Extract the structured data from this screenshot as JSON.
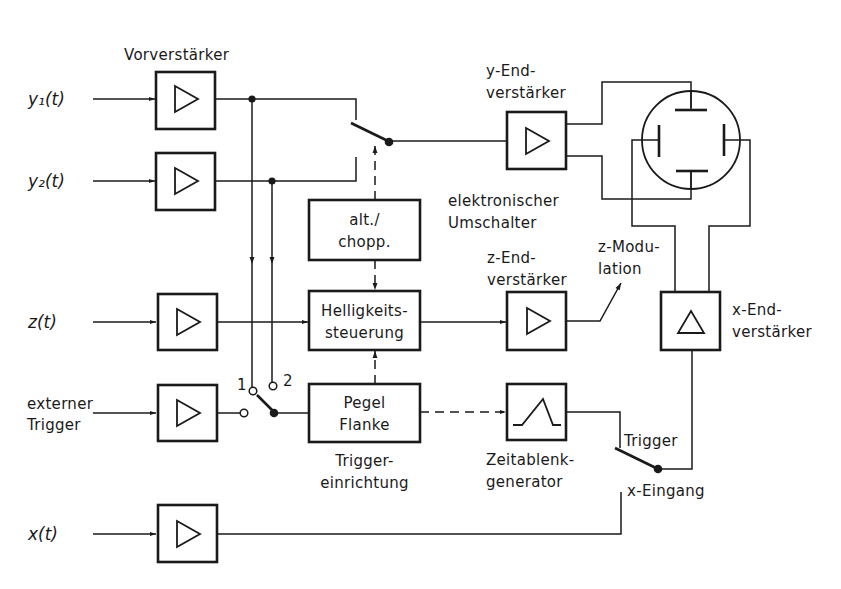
{
  "inputs": {
    "y1": "y₁(t)",
    "y2": "y₂(t)",
    "z": "z(t)",
    "ext_trigger": [
      "externer",
      "Trigger"
    ],
    "x": "x(t)"
  },
  "labels": {
    "preamp": "Vorverstärker",
    "alt_chopp": [
      "alt./",
      "chopp."
    ],
    "helligkeit": [
      "Helligkeits-",
      "steuerung"
    ],
    "pegel": [
      "Pegel",
      "Flanke"
    ],
    "trigger_einrichtung": [
      "Trigger-",
      "einrichtung"
    ],
    "y_end": [
      "y-End-",
      "verstärker"
    ],
    "elektronischer_umschalter": [
      "elektronischer",
      "Umschalter"
    ],
    "z_end": [
      "z-End-",
      "verstärker"
    ],
    "z_modulation": [
      "z-Modu-",
      "lation"
    ],
    "x_end": [
      "x-End-",
      "verstärker"
    ],
    "zeitablenk": [
      "Zeitablenk-",
      "generator"
    ],
    "trigger_switch": "Trigger",
    "x_eingang": "x-Eingang",
    "switch_pos_1": "1",
    "switch_pos_2": "2"
  },
  "colors": {
    "line": "#1a1a1a",
    "background": "#ffffff"
  }
}
